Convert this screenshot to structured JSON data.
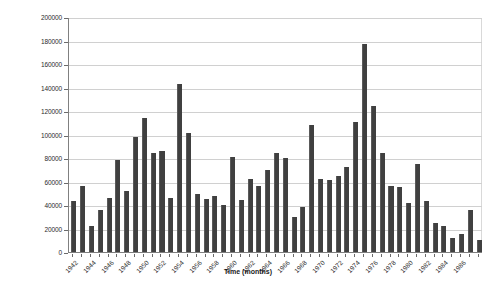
{
  "chart_data": {
    "type": "bar",
    "title": "",
    "xlabel": "Time (months)",
    "ylabel": "Reservoir annual inflow (m3)",
    "ylim": [
      0,
      200000
    ],
    "ytick_step": 20000,
    "ytick_labels": [
      "0",
      "20000",
      "40000",
      "60000",
      "80000",
      "100000",
      "120000",
      "140000",
      "160000",
      "180000",
      "200000"
    ],
    "grid": true,
    "legend": "none",
    "bar_color": "#404040",
    "plot_background": "#ffffff",
    "gridline_color": "#d0d0d0",
    "axis_color": "#808080",
    "xtick_label_interval": 2,
    "xtick_labels": [
      "1942",
      "1944",
      "1946",
      "1948",
      "1950",
      "1952",
      "1954",
      "1956",
      "1958",
      "1960",
      "1962",
      "1964",
      "1966",
      "1968",
      "1970",
      "1972",
      "1974",
      "1976",
      "1978",
      "1980",
      "1982",
      "1984",
      "1986"
    ],
    "categories": [
      "1942",
      "1943",
      "1944",
      "1945",
      "1946",
      "1947",
      "1948",
      "1949",
      "1950",
      "1951",
      "1952",
      "1953",
      "1954",
      "1955",
      "1956",
      "1957",
      "1958",
      "1959",
      "1960",
      "1961",
      "1962",
      "1963",
      "1964",
      "1965",
      "1966",
      "1967",
      "1968",
      "1969",
      "1970",
      "1971",
      "1972",
      "1973",
      "1974",
      "1975",
      "1976",
      "1977",
      "1978",
      "1979",
      "1980",
      "1981",
      "1982",
      "1983",
      "1984",
      "1985",
      "1986",
      "1987",
      "1988"
    ],
    "values": [
      43000,
      56000,
      22000,
      36000,
      46000,
      78000,
      52000,
      98000,
      114000,
      84000,
      86000,
      46000,
      143000,
      101000,
      49000,
      45000,
      48000,
      40000,
      81000,
      44000,
      62000,
      56000,
      70000,
      84000,
      80000,
      30000,
      38000,
      108000,
      62000,
      61000,
      65000,
      72000,
      111000,
      177000,
      124000,
      84000,
      56000,
      55000,
      42000,
      75000,
      43000,
      25000,
      22000,
      12000,
      15000,
      36000,
      10000
    ]
  }
}
